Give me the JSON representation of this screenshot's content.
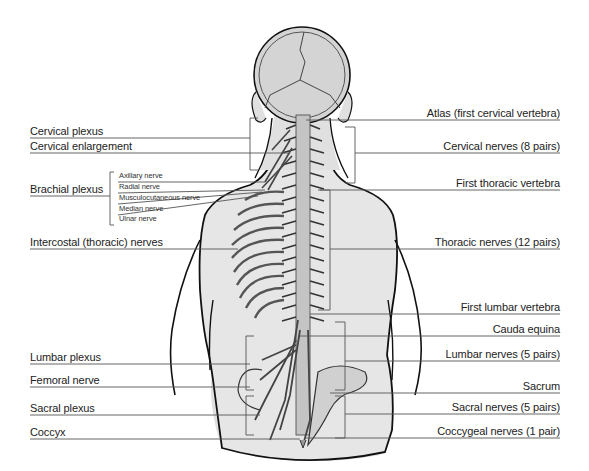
{
  "colors": {
    "body_fill": "#e6e6e6",
    "spine_fill": "#c8c8c8",
    "outline": "#111111",
    "leader_line": "#555555",
    "text": "#222222"
  },
  "labels_left": [
    {
      "id": "cervical-plexus",
      "text": "Cervical plexus"
    },
    {
      "id": "cervical-enlargement",
      "text": "Cervical enlargement"
    },
    {
      "id": "brachial-plexus",
      "text": "Brachial plexus"
    },
    {
      "id": "intercostal-nerves",
      "text": "Intercostal (thoracic) nerves"
    },
    {
      "id": "lumbar-plexus",
      "text": "Lumbar plexus"
    },
    {
      "id": "femoral-nerve",
      "text": "Femoral nerve"
    },
    {
      "id": "sacral-plexus",
      "text": "Sacral plexus"
    },
    {
      "id": "coccyx",
      "text": "Coccyx"
    }
  ],
  "brachial_branches": [
    {
      "id": "axillary-nerve",
      "text": "Axillary nerve"
    },
    {
      "id": "radial-nerve",
      "text": "Radial nerve"
    },
    {
      "id": "musculocutaneous-nerve",
      "text": "Musculocutaneous nerve"
    },
    {
      "id": "median-nerve",
      "text": "Median nerve"
    },
    {
      "id": "ulnar-nerve",
      "text": "Ulnar nerve"
    }
  ],
  "labels_right": [
    {
      "id": "atlas",
      "text": "Atlas (first cervical vertebra)"
    },
    {
      "id": "cervical-nerves",
      "text": "Cervical nerves (8 pairs)"
    },
    {
      "id": "first-thoracic-vertebra",
      "text": "First thoracic vertebra"
    },
    {
      "id": "thoracic-nerves",
      "text": "Thoracic nerves (12 pairs)"
    },
    {
      "id": "first-lumbar-vertebra",
      "text": "First lumbar vertebra"
    },
    {
      "id": "cauda-equina",
      "text": "Cauda equina"
    },
    {
      "id": "lumbar-nerves",
      "text": "Lumbar nerves (5 pairs)"
    },
    {
      "id": "sacrum",
      "text": "Sacrum"
    },
    {
      "id": "sacral-nerves",
      "text": "Sacral nerves (5 pairs)"
    },
    {
      "id": "coccygeal-nerves",
      "text": "Coccygeal nerves (1 pair)"
    }
  ]
}
